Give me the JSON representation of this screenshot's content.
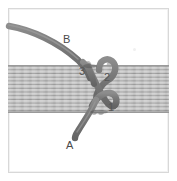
{
  "figure": {
    "background_color": "#ffffff",
    "frame": {
      "border_color": "#d8d8d8",
      "x": 8,
      "y": 8,
      "width": 161,
      "height": 165
    },
    "strap": {
      "name": "webbing-strap",
      "orientation": "horizontal",
      "top": 65,
      "bottom": 113,
      "base_color": "#b4b4b4",
      "highlight_color": "#cfcfcf",
      "line_color": "#8f8f8f",
      "stripe_count": 13
    },
    "rope": {
      "name": "rope",
      "color": "#7b7b7b",
      "shadow_color": "#636363",
      "highlight_color": "#959595",
      "width_px": 6
    },
    "labels": [
      {
        "id": "A",
        "text": "A",
        "role": "standing-end",
        "x": 66,
        "y": 140
      },
      {
        "id": "B",
        "text": "B",
        "role": "working-end",
        "x": 63,
        "y": 34
      },
      {
        "id": "1",
        "text": "1",
        "role": "crossing-point",
        "x": 108,
        "y": 102
      },
      {
        "id": "2",
        "text": "2",
        "role": "crossing-point",
        "x": 104,
        "y": 72
      },
      {
        "id": "3",
        "text": "3",
        "role": "crossing-point",
        "x": 79,
        "y": 66
      }
    ]
  }
}
